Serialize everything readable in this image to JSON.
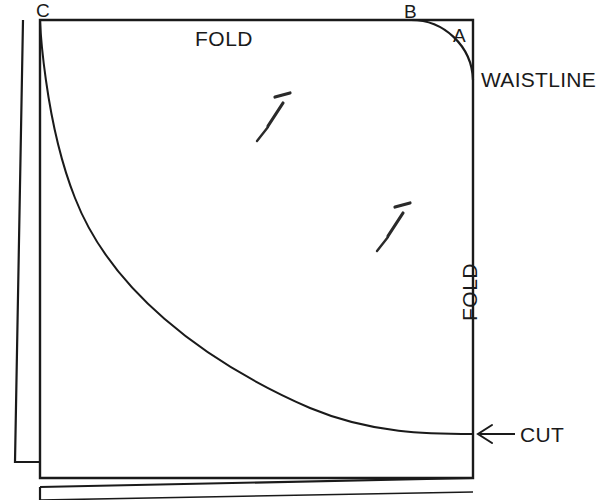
{
  "figure": {
    "background_color": "#ffffff",
    "ink_color": "#1a1a1a"
  },
  "labels": {
    "corner_c": "C",
    "corner_b": "B",
    "corner_a": "A",
    "fold_top": "FOLD",
    "fold_right": "FOLD",
    "waistline": "WAISTLINE",
    "cut": "CUT"
  },
  "markers": {
    "pin_one": "pin",
    "pin_two": "pin",
    "cut_arrow": "left-arrow"
  },
  "geometry": {
    "fabric_rect": {
      "x": 40,
      "y": 20,
      "width": 433,
      "height": 458
    },
    "waistline_arc": {
      "from_x": 410,
      "from_y": 20,
      "to_x": 473,
      "to_y": 80,
      "radius": 62
    },
    "hem_curve": {
      "from_x": 40,
      "from_y": 20,
      "to_x": 473,
      "to_y": 434
    },
    "pin_one_pos": {
      "x": 258,
      "y": 98
    },
    "pin_two_pos": {
      "x": 378,
      "y": 208
    },
    "cut_arrow_line": {
      "from_x": 515,
      "from_y": 434,
      "to_x": 478,
      "to_y": 434
    }
  }
}
